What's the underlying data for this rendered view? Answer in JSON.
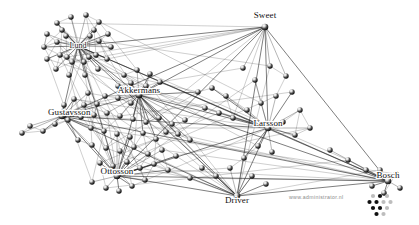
{
  "figure": {
    "type": "network-graph",
    "title": "",
    "background_color": "#ffffff",
    "node_color": "#111111",
    "edge_color": "#1b1b1b"
  },
  "labels": {
    "lund": "Lund",
    "sweet": "Sweet",
    "akkermans": "Akkermans",
    "gustavsson": "Gustavsson",
    "ottosson": "Ottosson",
    "larsson": "Larsson",
    "driver": "Driver",
    "bosch": "Bosch"
  },
  "watermark": {
    "text": "www.administrator.nl"
  },
  "chart_data": {
    "type": "scatter",
    "title": "",
    "xlabel": "",
    "ylabel": "",
    "hubs": [
      {
        "id": "lund",
        "label": "Lund",
        "x": 78,
        "y": 46,
        "degree": 26
      },
      {
        "id": "sweet",
        "label": "Sweet",
        "x": 265,
        "y": 27,
        "degree": 14
      },
      {
        "id": "akkermans",
        "label": "Akkermans",
        "x": 139,
        "y": 95,
        "degree": 18
      },
      {
        "id": "gustavsson",
        "label": "Gustavsson",
        "x": 62,
        "y": 116,
        "degree": 9
      },
      {
        "id": "ottosson",
        "label": "Ottosson",
        "x": 117,
        "y": 176,
        "degree": 12
      },
      {
        "id": "larsson",
        "label": "Larsson",
        "x": 268,
        "y": 128,
        "degree": 16
      },
      {
        "id": "driver",
        "label": "Driver",
        "x": 237,
        "y": 196,
        "degree": 11
      },
      {
        "id": "bosch",
        "label": "Bosch",
        "x": 388,
        "y": 181,
        "degree": 10
      }
    ],
    "nodes": [
      {
        "x": 71,
        "y": 17
      },
      {
        "x": 86,
        "y": 15
      },
      {
        "x": 57,
        "y": 23
      },
      {
        "x": 99,
        "y": 22
      },
      {
        "x": 47,
        "y": 34
      },
      {
        "x": 108,
        "y": 34
      },
      {
        "x": 44,
        "y": 47
      },
      {
        "x": 111,
        "y": 47
      },
      {
        "x": 47,
        "y": 59
      },
      {
        "x": 107,
        "y": 59
      },
      {
        "x": 56,
        "y": 69
      },
      {
        "x": 98,
        "y": 69
      },
      {
        "x": 69,
        "y": 75
      },
      {
        "x": 85,
        "y": 75
      },
      {
        "x": 62,
        "y": 30
      },
      {
        "x": 94,
        "y": 30
      },
      {
        "x": 57,
        "y": 42
      },
      {
        "x": 99,
        "y": 41
      },
      {
        "x": 60,
        "y": 55
      },
      {
        "x": 96,
        "y": 55
      },
      {
        "x": 72,
        "y": 62
      },
      {
        "x": 84,
        "y": 62
      },
      {
        "x": 66,
        "y": 36
      },
      {
        "x": 90,
        "y": 36
      },
      {
        "x": 67,
        "y": 57
      },
      {
        "x": 89,
        "y": 57
      },
      {
        "x": 124,
        "y": 75
      },
      {
        "x": 137,
        "y": 70
      },
      {
        "x": 150,
        "y": 74
      },
      {
        "x": 160,
        "y": 82
      },
      {
        "x": 118,
        "y": 86
      },
      {
        "x": 131,
        "y": 83
      },
      {
        "x": 146,
        "y": 86
      },
      {
        "x": 105,
        "y": 96
      },
      {
        "x": 118,
        "y": 98
      },
      {
        "x": 131,
        "y": 103
      },
      {
        "x": 88,
        "y": 93
      },
      {
        "x": 97,
        "y": 104
      },
      {
        "x": 84,
        "y": 105
      },
      {
        "x": 74,
        "y": 99
      },
      {
        "x": 64,
        "y": 105
      },
      {
        "x": 30,
        "y": 126
      },
      {
        "x": 43,
        "y": 131
      },
      {
        "x": 22,
        "y": 133
      },
      {
        "x": 55,
        "y": 124
      },
      {
        "x": 68,
        "y": 120
      },
      {
        "x": 81,
        "y": 117
      },
      {
        "x": 94,
        "y": 115
      },
      {
        "x": 107,
        "y": 113
      },
      {
        "x": 120,
        "y": 116
      },
      {
        "x": 133,
        "y": 119
      },
      {
        "x": 146,
        "y": 122
      },
      {
        "x": 159,
        "y": 118
      },
      {
        "x": 172,
        "y": 124
      },
      {
        "x": 185,
        "y": 120
      },
      {
        "x": 91,
        "y": 128
      },
      {
        "x": 104,
        "y": 131
      },
      {
        "x": 117,
        "y": 134
      },
      {
        "x": 130,
        "y": 137
      },
      {
        "x": 143,
        "y": 133
      },
      {
        "x": 156,
        "y": 139
      },
      {
        "x": 78,
        "y": 140
      },
      {
        "x": 92,
        "y": 145
      },
      {
        "x": 106,
        "y": 148
      },
      {
        "x": 120,
        "y": 151
      },
      {
        "x": 134,
        "y": 147
      },
      {
        "x": 148,
        "y": 154
      },
      {
        "x": 162,
        "y": 150
      },
      {
        "x": 176,
        "y": 156
      },
      {
        "x": 100,
        "y": 163
      },
      {
        "x": 113,
        "y": 166
      },
      {
        "x": 127,
        "y": 162
      },
      {
        "x": 140,
        "y": 168
      },
      {
        "x": 154,
        "y": 164
      },
      {
        "x": 168,
        "y": 170
      },
      {
        "x": 106,
        "y": 188
      },
      {
        "x": 119,
        "y": 191
      },
      {
        "x": 132,
        "y": 186
      },
      {
        "x": 145,
        "y": 180
      },
      {
        "x": 92,
        "y": 182
      },
      {
        "x": 198,
        "y": 92
      },
      {
        "x": 212,
        "y": 88
      },
      {
        "x": 226,
        "y": 96
      },
      {
        "x": 205,
        "y": 108
      },
      {
        "x": 219,
        "y": 113
      },
      {
        "x": 233,
        "y": 118
      },
      {
        "x": 247,
        "y": 110
      },
      {
        "x": 261,
        "y": 103
      },
      {
        "x": 276,
        "y": 96
      },
      {
        "x": 255,
        "y": 80
      },
      {
        "x": 243,
        "y": 68
      },
      {
        "x": 270,
        "y": 66
      },
      {
        "x": 286,
        "y": 76
      },
      {
        "x": 292,
        "y": 92
      },
      {
        "x": 300,
        "y": 110
      },
      {
        "x": 283,
        "y": 122
      },
      {
        "x": 295,
        "y": 135
      },
      {
        "x": 310,
        "y": 128
      },
      {
        "x": 258,
        "y": 146
      },
      {
        "x": 272,
        "y": 152
      },
      {
        "x": 244,
        "y": 158
      },
      {
        "x": 230,
        "y": 168
      },
      {
        "x": 216,
        "y": 176
      },
      {
        "x": 202,
        "y": 168
      },
      {
        "x": 190,
        "y": 178
      },
      {
        "x": 252,
        "y": 176
      },
      {
        "x": 266,
        "y": 184
      },
      {
        "x": 330,
        "y": 150
      },
      {
        "x": 348,
        "y": 160
      },
      {
        "x": 366,
        "y": 170
      },
      {
        "x": 380,
        "y": 170
      },
      {
        "x": 396,
        "y": 174
      },
      {
        "x": 400,
        "y": 188
      },
      {
        "x": 384,
        "y": 193
      },
      {
        "x": 372,
        "y": 186
      },
      {
        "x": 190,
        "y": 140
      },
      {
        "x": 178,
        "y": 134
      },
      {
        "x": 166,
        "y": 132
      }
    ]
  }
}
